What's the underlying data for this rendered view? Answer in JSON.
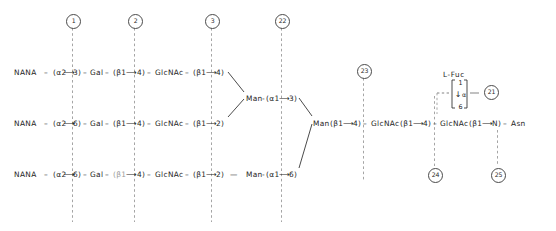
{
  "diagram": {
    "ink_color": "#1d1d1d",
    "dash_color": "#9b9b9b",
    "background": "#ffffff"
  },
  "markers": [
    {
      "id": "m1",
      "label": "1",
      "x": 66,
      "y": 14,
      "line_from": 28,
      "line_to": 222
    },
    {
      "id": "m2",
      "label": "2",
      "x": 128,
      "y": 14,
      "line_from": 28,
      "line_to": 222
    },
    {
      "id": "m3",
      "label": "3",
      "x": 205,
      "y": 14,
      "line_from": 28,
      "line_to": 222
    },
    {
      "id": "m22",
      "label": "22",
      "x": 275,
      "y": 14,
      "line_from": 28,
      "line_to": 222
    },
    {
      "id": "m23",
      "label": "23",
      "x": 357,
      "y": 64,
      "line_from": 78,
      "line_to": 182
    },
    {
      "id": "m24",
      "label": "24",
      "x": 428,
      "y": 168,
      "line_from": 96,
      "line_to": 166
    },
    {
      "id": "m25",
      "label": "25",
      "x": 491,
      "y": 168,
      "line_from": 130,
      "line_to": 166
    },
    {
      "id": "m21",
      "label": "21",
      "x": 484,
      "y": 85,
      "line_from": 0,
      "line_to": 0
    }
  ],
  "antennae": [
    {
      "name": "antenna-3",
      "y": 69,
      "segments": [
        {
          "text": "NANA",
          "x": 14
        },
        {
          "text": "–",
          "x": 44
        },
        {
          "text": "(α2",
          "x": 53
        },
        {
          "text": "⟶",
          "x": 64
        },
        {
          "text": "3)",
          "x": 73
        },
        {
          "text": "–",
          "x": 83
        },
        {
          "text": "Gal",
          "x": 90
        },
        {
          "text": "–",
          "x": 105
        },
        {
          "text": "(β1",
          "x": 113
        },
        {
          "text": "⟶",
          "x": 126
        },
        {
          "text": "4)",
          "x": 137
        },
        {
          "text": "–",
          "x": 147
        },
        {
          "text": "GlcNAc",
          "x": 155
        },
        {
          "text": "–",
          "x": 185
        },
        {
          "text": "(β1",
          "x": 193
        },
        {
          "text": "⟶",
          "x": 206
        },
        {
          "text": "4)",
          "x": 216
        }
      ]
    },
    {
      "name": "antenna-2",
      "y": 120,
      "segments": [
        {
          "text": "NANA",
          "x": 14
        },
        {
          "text": "–",
          "x": 44
        },
        {
          "text": "(α2",
          "x": 53
        },
        {
          "text": "⟶",
          "x": 64
        },
        {
          "text": "6)",
          "x": 73
        },
        {
          "text": "–",
          "x": 83
        },
        {
          "text": "Gal",
          "x": 90
        },
        {
          "text": "–",
          "x": 105
        },
        {
          "text": "(β1",
          "x": 113
        },
        {
          "text": "⟶",
          "x": 126
        },
        {
          "text": "4)",
          "x": 137
        },
        {
          "text": "–",
          "x": 147
        },
        {
          "text": "GlcNAc",
          "x": 155
        },
        {
          "text": "–",
          "x": 185
        },
        {
          "text": "(β1",
          "x": 193
        },
        {
          "text": "⟶",
          "x": 206
        },
        {
          "text": "2)",
          "x": 216
        }
      ]
    },
    {
      "name": "antenna-1",
      "y": 171,
      "segments": [
        {
          "text": "NANA",
          "x": 14
        },
        {
          "text": "–",
          "x": 44
        },
        {
          "text": "(α2",
          "x": 53
        },
        {
          "text": "⟶",
          "x": 64
        },
        {
          "text": "6)",
          "x": 73
        },
        {
          "text": "–",
          "x": 83
        },
        {
          "text": "Gal",
          "x": 90
        },
        {
          "text": "–",
          "x": 105
        },
        {
          "text": "(β1",
          "x": 113,
          "faded": true
        },
        {
          "text": "⟶",
          "x": 126
        },
        {
          "text": "4)",
          "x": 137
        },
        {
          "text": "–",
          "x": 147
        },
        {
          "text": "GlcNAc",
          "x": 155
        },
        {
          "text": "–",
          "x": 185
        },
        {
          "text": "(β1",
          "x": 193
        },
        {
          "text": "⟶",
          "x": 206
        },
        {
          "text": "2)",
          "x": 216
        },
        {
          "text": "—",
          "x": 230
        },
        {
          "text": "Man",
          "x": 246
        },
        {
          "text": "-",
          "x": 262
        },
        {
          "text": "(α1",
          "x": 266
        },
        {
          "text": "⟶",
          "x": 279
        },
        {
          "text": "6)",
          "x": 289
        }
      ]
    }
  ],
  "branch_nodes": [
    {
      "name": "man-alpha-1-3",
      "y": 95,
      "segments": [
        {
          "text": "Man",
          "x": 246
        },
        {
          "text": "-",
          "x": 262
        },
        {
          "text": "(α1",
          "x": 266
        },
        {
          "text": "⟶",
          "x": 279
        },
        {
          "text": "3)",
          "x": 289
        }
      ]
    }
  ],
  "core": {
    "name": "core-chain",
    "y": 120,
    "segments": [
      {
        "text": "Man",
        "x": 313
      },
      {
        "text": "(β1",
        "x": 330
      },
      {
        "text": "⟶",
        "x": 343
      },
      {
        "text": "4)",
        "x": 353
      },
      {
        "text": "–",
        "x": 363
      },
      {
        "text": "GlcNAc",
        "x": 371
      },
      {
        "text": "(β1",
        "x": 400
      },
      {
        "text": "⟶",
        "x": 413
      },
      {
        "text": "4)",
        "x": 423
      },
      {
        "text": "–",
        "x": 433
      },
      {
        "text": "GlcNAc",
        "x": 440
      },
      {
        "text": "(β1",
        "x": 469
      },
      {
        "text": "⟶",
        "x": 482
      },
      {
        "text": "N)",
        "x": 492
      },
      {
        "text": "–",
        "x": 503
      },
      {
        "text": "Asn",
        "x": 511
      }
    ]
  },
  "fucose": {
    "label": "L-Fuc",
    "label_x": 443,
    "label_y": 70,
    "box_x": 453,
    "box_y": 79,
    "top_number": "1",
    "bottom_number": "6",
    "anomeric": "α",
    "arrow": "↓"
  },
  "connectors": {
    "upper_branch_note": "antenna-3 and antenna-2 converge on Man-(α1→3)",
    "lower_branch_note": "Man-(α1→3) and Man-(α1→6) converge on Man(β1→4) core"
  }
}
